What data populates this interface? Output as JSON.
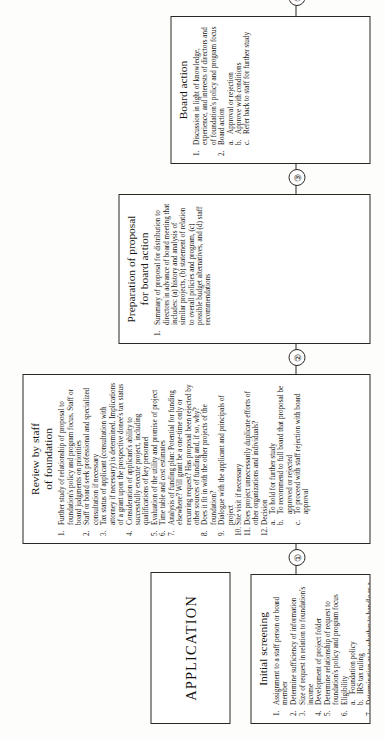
{
  "document": {
    "orientation_label": "APPLICATION"
  },
  "connectors": [
    {
      "id": 1,
      "glyph": "①"
    },
    {
      "id": 2,
      "glyph": "②"
    },
    {
      "id": 3,
      "glyph": "③"
    },
    {
      "id": 4,
      "glyph": "④"
    }
  ],
  "stages": [
    {
      "title_line1": "Initial screening",
      "title_line2": "",
      "items": [
        {
          "num": "1.",
          "text": "Assignment to a staff person or board member"
        },
        {
          "num": "2.",
          "text": "Determine sufficiency of information"
        },
        {
          "num": "3.",
          "text": "Size of request in relation to foundation's income"
        },
        {
          "num": "4.",
          "text": "Development of project folder"
        },
        {
          "num": "5.",
          "text": "Determine relationship of request to foundation's policy and program focus"
        },
        {
          "num": "6.",
          "text": "Eligibility",
          "sub": [
            {
              "num": "a.",
              "text": "Foundation policy"
            },
            {
              "num": "b.",
              "text": "IRS tax ruling"
            }
          ]
        },
        {
          "num": "7.",
          "text": "Determination as to whether to handle as a staff reject or complete study for board action"
        }
      ]
    },
    {
      "title_line1": "Review by staff",
      "title_line2": "of foundation",
      "items": [
        {
          "num": "1.",
          "text": "Further study of relationship of proposal to foundation's policy and program focus. Staff or board judgments on priorities"
        },
        {
          "num": "2.",
          "text": "Staff or board seek professional and specialized consultation if necessary"
        },
        {
          "num": "3.",
          "text": "Tax status of applicant (consultation with attorney if necessary) is determined. Implications of a grant upon the prospective donee's tax status"
        },
        {
          "num": "4.",
          "text": "Consideration of applicant's ability to successfully execute project, including qualifications of key personnel"
        },
        {
          "num": "5.",
          "text": "Evaluation of the utility and promise of project"
        },
        {
          "num": "6.",
          "text": "Time table and cost estimates"
        },
        {
          "num": "7.",
          "text": "Analysis of funding plan: Potential for funding elsewhere? Will grant be a one-time only or recurring request? Has proposal been rejected by other sources of funding and, if so, why?"
        },
        {
          "num": "8.",
          "text": "Does it fit in with the other projects of the foundation?"
        },
        {
          "num": "9.",
          "text": "Dialogue with the applicant and principals of project"
        },
        {
          "num": "10.",
          "text": "Site visit if necessary"
        },
        {
          "num": "11.",
          "text": "Does project unnecessarily duplicate efforts of other organizations and individuals?"
        },
        {
          "num": "12.",
          "text": "Decision",
          "sub": [
            {
              "num": "a.",
              "text": "To hold for further study"
            },
            {
              "num": "b.",
              "text": "To recommend to full board that proposal be approved or rejected"
            },
            {
              "num": "c.",
              "text": "To proceed with staff rejection with board approval"
            }
          ]
        }
      ]
    },
    {
      "title_line1": "Preparation of proposal",
      "title_line2": "for board action",
      "items": [
        {
          "num": "1.",
          "text": "Summary of proposal for distribution to directors in advance of board meeting that includes: (a) history and analysis of similar projects, (b) statement of relation to overall policies and program, (c) possible budget alternatives, and (d) staff recommendations"
        }
      ]
    },
    {
      "title_line1": "Board action",
      "title_line2": "",
      "items": [
        {
          "num": "1.",
          "text": "Discussion in light of knowledge, experience, and interests of directors and of foundation's policy and program focus"
        },
        {
          "num": "2.",
          "text": "Board action",
          "sub": [
            {
              "num": "a.",
              "text": "Approval or rejection"
            },
            {
              "num": "b.",
              "text": "Approve with conditions"
            },
            {
              "num": "c.",
              "text": "Refer back to staff for further study"
            }
          ]
        }
      ]
    }
  ]
}
